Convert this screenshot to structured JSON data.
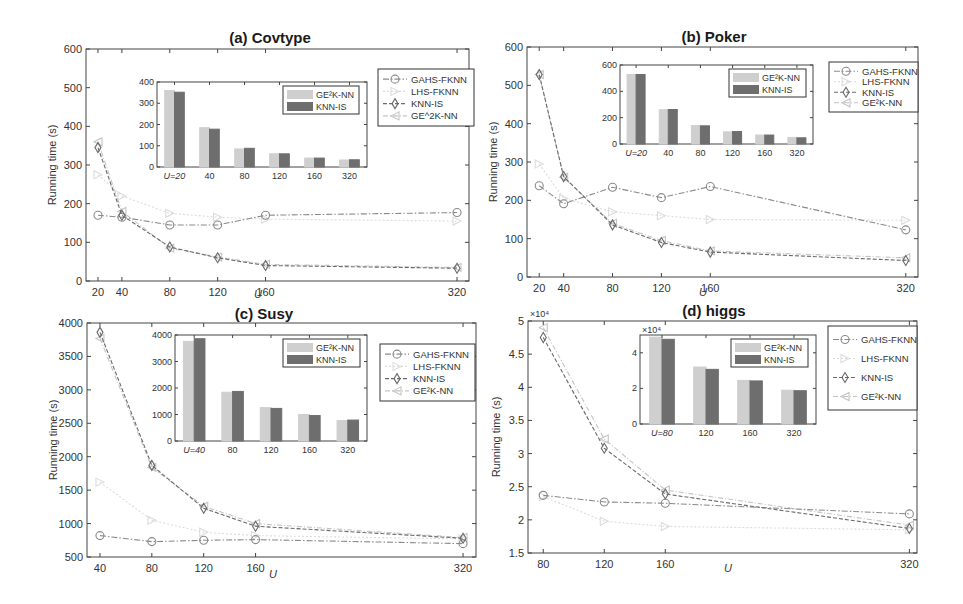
{
  "figure": {
    "series_names": [
      "GAHS-FKNN",
      "LHS-FKNN",
      "KNN-IS",
      "GE2K-NN"
    ],
    "series_styles": {
      "GAHS-FKNN": {
        "color": "#8a8a8a",
        "marker": "circle",
        "dash": "6,2,1.5,2"
      },
      "LHS-FKNN": {
        "color": "#dcdcdc",
        "marker": "triangle-right",
        "dash": "2,2"
      },
      "KNN-IS": {
        "color": "#6a6a6a",
        "marker": "diamond",
        "dash": "4,2"
      },
      "GE2K-NN": {
        "color": "#c4c4c4",
        "marker": "triangle-left",
        "dash": "5,2,1,2"
      }
    },
    "bar_colors": {
      "GE2K-NN": "#cfcfcf",
      "KNN-IS": "#6e6e6e"
    }
  },
  "chart_data": [
    {
      "type": "line",
      "title": "(a) Covtype",
      "xlabel": "U",
      "ylabel": "Running time (s)",
      "x": [
        20,
        40,
        80,
        120,
        160,
        320
      ],
      "xlim": [
        10,
        330
      ],
      "ylim": [
        0,
        600
      ],
      "yticks": [
        0,
        100,
        200,
        300,
        400,
        500,
        600
      ],
      "legend": [
        "GAHS-FKNN",
        "LHS-FKNN",
        "KNN-IS",
        "GE^2K-NN"
      ],
      "legend_position": "upper right, outside inset",
      "series": [
        {
          "name": "GAHS-FKNN",
          "values": [
            170,
            165,
            145,
            145,
            170,
            177
          ]
        },
        {
          "name": "LHS-FKNN",
          "values": [
            275,
            220,
            175,
            165,
            160,
            155
          ]
        },
        {
          "name": "KNN-IS",
          "values": [
            345,
            170,
            88,
            60,
            40,
            33
          ]
        },
        {
          "name": "GE2K-NN",
          "values": [
            360,
            180,
            85,
            62,
            43,
            35
          ]
        }
      ],
      "inset": {
        "type": "bar",
        "categories": [
          "U=20",
          "40",
          "80",
          "120",
          "160",
          "320"
        ],
        "ylim": [
          0,
          400
        ],
        "yticks": [
          0,
          100,
          200,
          300,
          400
        ],
        "legend": [
          "GE²K-NN",
          "KNN-IS"
        ],
        "series": [
          {
            "name": "GE2K-NN",
            "values": [
              360,
              185,
              85,
              62,
              42,
              33
            ]
          },
          {
            "name": "KNN-IS",
            "values": [
              352,
              178,
              88,
              62,
              42,
              34
            ]
          }
        ]
      }
    },
    {
      "type": "line",
      "title": "(b) Poker",
      "xlabel": "U",
      "ylabel": "Running time (s)",
      "x": [
        20,
        40,
        80,
        120,
        160,
        320
      ],
      "xlim": [
        10,
        330
      ],
      "ylim": [
        0,
        600
      ],
      "yticks": [
        0,
        100,
        200,
        300,
        400,
        500,
        600
      ],
      "legend": [
        "GAHS-FKNN",
        "LHS-FKNN",
        "KNN-IS",
        "GE²K-NN"
      ],
      "legend_position": "upper right",
      "series": [
        {
          "name": "GAHS-FKNN",
          "values": [
            238,
            191,
            234,
            207,
            236,
            123
          ]
        },
        {
          "name": "LHS-FKNN",
          "values": [
            295,
            205,
            170,
            160,
            150,
            148
          ]
        },
        {
          "name": "KNN-IS",
          "values": [
            528,
            262,
            136,
            90,
            65,
            43
          ]
        },
        {
          "name": "GE2K-NN",
          "values": [
            528,
            260,
            140,
            95,
            68,
            50
          ]
        }
      ],
      "inset": {
        "type": "bar",
        "categories": [
          "U=20",
          "40",
          "80",
          "120",
          "160",
          "320"
        ],
        "ylim": [
          0,
          600
        ],
        "yticks": [
          0,
          200,
          400,
          600
        ],
        "legend": [
          "GE²K-NN",
          "KNN-IS"
        ],
        "series": [
          {
            "name": "GE2K-NN",
            "values": [
              528,
              260,
              140,
              92,
              68,
              50
            ]
          },
          {
            "name": "KNN-IS",
            "values": [
              528,
              262,
              138,
              95,
              68,
              47
            ]
          }
        ]
      }
    },
    {
      "type": "line",
      "title": "(c) Susy",
      "xlabel": "U",
      "ylabel": "Running time (s)",
      "x": [
        40,
        80,
        120,
        160,
        320
      ],
      "xlim": [
        30,
        330
      ],
      "ylim": [
        500,
        4000
      ],
      "yticks": [
        500,
        1000,
        1500,
        2000,
        2500,
        3000,
        3500,
        4000
      ],
      "legend": [
        "GAHS-FKNN",
        "LHS-FKNN",
        "KNN-IS",
        "GE²K-NN"
      ],
      "legend_position": "upper right",
      "series": [
        {
          "name": "GAHS-FKNN",
          "values": [
            820,
            730,
            750,
            760,
            700
          ]
        },
        {
          "name": "LHS-FKNN",
          "values": [
            1620,
            1050,
            870,
            820,
            770
          ]
        },
        {
          "name": "KNN-IS",
          "values": [
            3860,
            1870,
            1230,
            960,
            780
          ]
        },
        {
          "name": "GE2K-NN",
          "values": [
            3770,
            1840,
            1260,
            1000,
            790
          ]
        }
      ],
      "inset": {
        "type": "bar",
        "categories": [
          "U=40",
          "80",
          "120",
          "160",
          "320"
        ],
        "ylim": [
          0,
          4000
        ],
        "yticks": [
          0,
          1000,
          2000,
          3000,
          4000
        ],
        "legend": [
          "GE²K-NN",
          "KNN-IS"
        ],
        "series": [
          {
            "name": "GE2K-NN",
            "values": [
              3760,
              1840,
              1260,
              1000,
              770
            ]
          },
          {
            "name": "KNN-IS",
            "values": [
              3860,
              1870,
              1230,
              960,
              790
            ]
          }
        ]
      }
    },
    {
      "type": "line",
      "title": "(d) higgs",
      "xlabel": "U",
      "ylabel": "Running time (s)",
      "y_multiplier": "×10⁴",
      "x": [
        80,
        120,
        160,
        320
      ],
      "xlim": [
        70,
        325
      ],
      "ylim": [
        1.5,
        5
      ],
      "yticks": [
        1.5,
        2,
        2.5,
        3,
        3.5,
        4,
        4.5,
        5
      ],
      "legend": [
        "GAHS-FKNN",
        "LHS-FKNN",
        "KNN-IS",
        "GE²K-NN"
      ],
      "legend_position": "upper right",
      "series": [
        {
          "name": "GAHS-FKNN",
          "values": [
            2.37,
            2.27,
            2.25,
            2.09
          ]
        },
        {
          "name": "LHS-FKNN",
          "values": [
            2.35,
            1.98,
            1.9,
            1.85
          ]
        },
        {
          "name": "KNN-IS",
          "values": [
            4.75,
            3.08,
            2.39,
            1.87
          ]
        },
        {
          "name": "GE2K-NN",
          "values": [
            4.9,
            3.22,
            2.45,
            1.92
          ]
        }
      ],
      "inset": {
        "type": "bar",
        "categories": [
          "U=80",
          "120",
          "160",
          "320"
        ],
        "ylim": [
          0,
          5
        ],
        "yticks": [
          0,
          2,
          4
        ],
        "y_multiplier": "×10⁴",
        "legend": [
          "GE²K-NN",
          "KNN-IS"
        ],
        "series": [
          {
            "name": "GE2K-NN",
            "values": [
              4.88,
              3.2,
              2.45,
              1.9
            ]
          },
          {
            "name": "KNN-IS",
            "values": [
              4.76,
              3.07,
              2.42,
              1.87
            ]
          }
        ]
      }
    }
  ]
}
